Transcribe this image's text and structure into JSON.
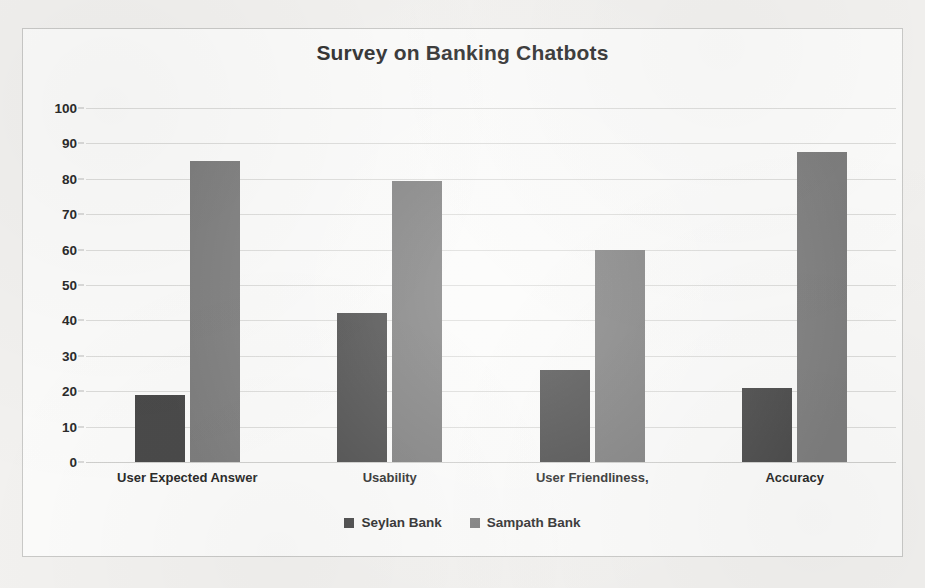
{
  "chart_data": {
    "type": "bar",
    "title": "Survey on Banking Chatbots",
    "xlabel": "",
    "ylabel": "",
    "ylim": [
      0,
      100
    ],
    "ytick_step": 10,
    "yticks": [
      100,
      90,
      80,
      70,
      60,
      50,
      40,
      30,
      20,
      10,
      0
    ],
    "grid": true,
    "legend_position": "bottom",
    "categories": [
      "User Expected Answer",
      "Usability",
      "User Friendliness,",
      "Accuracy"
    ],
    "series": [
      {
        "name": "Seylan Bank",
        "color": "#4a4a4a",
        "values": [
          19,
          42,
          26,
          21
        ]
      },
      {
        "name": "Sampath Bank",
        "color": "#7d7d7d",
        "values": [
          85,
          79.5,
          60,
          87.5
        ]
      }
    ]
  },
  "colors": {
    "page_background": "#f2f1ef",
    "chart_background": "#fbfbfa",
    "chart_border": "#c9c9c7",
    "gridline": "#dcdcda",
    "text": "#2b2b2b",
    "series_1": "#4a4a4a",
    "series_2": "#7d7d7d"
  }
}
